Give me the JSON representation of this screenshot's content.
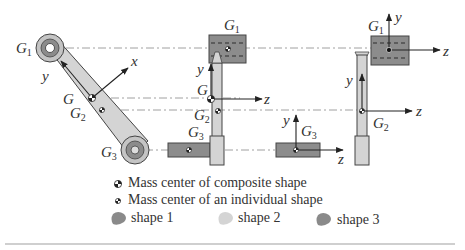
{
  "figure": {
    "views": [
      {
        "name": "inclined-link-view",
        "labels": {
          "G1": "G",
          "G1_sub": "1",
          "G": "G",
          "G2": "G",
          "G2_sub": "2",
          "G3": "G",
          "G3_sub": "3",
          "x_axis": "x",
          "y_axis": "y"
        }
      },
      {
        "name": "vertical-link-side-view",
        "labels": {
          "G1": "G",
          "G1_sub": "1",
          "G": "G",
          "G2": "G",
          "G2_sub": "2",
          "G3": "G",
          "G3_sub": "3",
          "y_axis": "y",
          "z_axis": "z"
        }
      },
      {
        "name": "shape3-view",
        "labels": {
          "G3": "G",
          "G3_sub": "3",
          "y_axis": "y",
          "z_axis": "z"
        }
      },
      {
        "name": "shape2-view",
        "labels": {
          "G2": "G",
          "G2_sub": "2",
          "y_axis": "y",
          "z_axis": "z"
        }
      },
      {
        "name": "shape1-view",
        "labels": {
          "G1": "G",
          "G1_sub": "1",
          "y_axis": "y",
          "z_axis": "z"
        }
      }
    ]
  },
  "legend": {
    "composite_marker": "Mass center of composite shape",
    "individual_marker": "Mass center of an individual shape",
    "shapes": [
      {
        "label": "shape 1",
        "color": "#8a8a8a"
      },
      {
        "label": "shape 2",
        "color": "#d4d4d4"
      },
      {
        "label": "shape 3",
        "color": "#8a8a8a"
      }
    ]
  },
  "colors": {
    "dark_shape": "#8c8c8c",
    "light_shape": "#d2d2d2",
    "line": "#333333",
    "centerline": "#777777",
    "divider": "#cfcfcf"
  }
}
